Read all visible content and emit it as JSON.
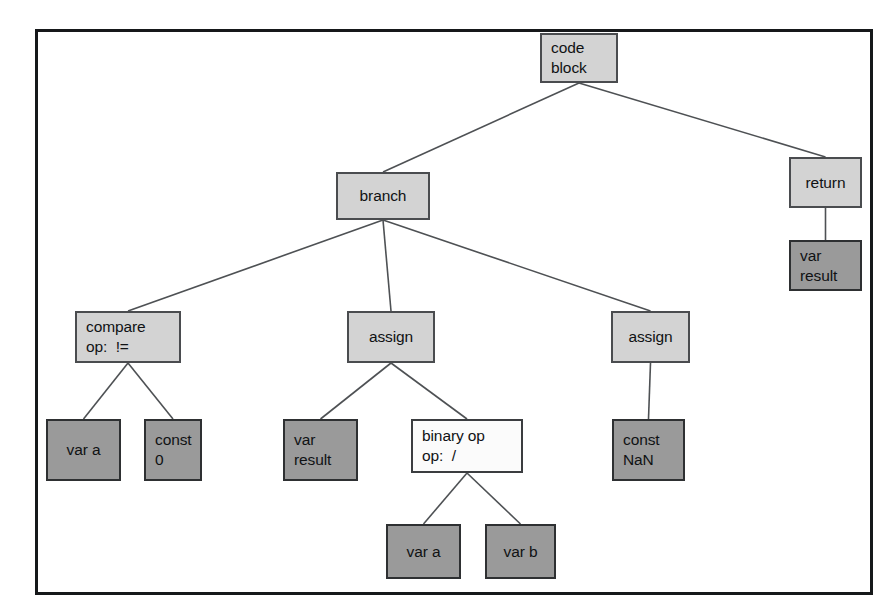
{
  "diagram": {
    "frame": {
      "border_color": "#16181a",
      "background": "#ffffff"
    },
    "colors": {
      "light_node_fill": "#d3d3d3",
      "dark_node_fill": "#9a9a9a",
      "white_node_fill": "#fbfbfb",
      "node_border": "#3b3d40",
      "edge_color": "#4e5154",
      "text_color": "#101214"
    },
    "nodes": [
      {
        "id": "code-block",
        "line1": "code",
        "line2": "block",
        "fill": "light",
        "x": 540,
        "y": 33,
        "w": 78,
        "h": 50
      },
      {
        "id": "branch",
        "line1": "branch",
        "line2": "",
        "fill": "light",
        "x": 336,
        "y": 172,
        "w": 94,
        "h": 48
      },
      {
        "id": "return",
        "line1": "return",
        "line2": "",
        "fill": "light",
        "x": 789,
        "y": 157,
        "w": 73,
        "h": 51
      },
      {
        "id": "var-result-r",
        "line1": "var",
        "line2": "result",
        "fill": "dark",
        "x": 789,
        "y": 240,
        "w": 73,
        "h": 51
      },
      {
        "id": "compare",
        "line1": "compare",
        "line2": "op:  !=",
        "fill": "light",
        "x": 75,
        "y": 311,
        "w": 106,
        "h": 52
      },
      {
        "id": "assign-mid",
        "line1": "assign",
        "line2": "",
        "fill": "light",
        "x": 347,
        "y": 311,
        "w": 88,
        "h": 52
      },
      {
        "id": "assign-right",
        "line1": "assign",
        "line2": "",
        "fill": "light",
        "x": 611,
        "y": 311,
        "w": 79,
        "h": 52
      },
      {
        "id": "var-a-1",
        "line1": "var a",
        "line2": "",
        "fill": "dark",
        "x": 46,
        "y": 419,
        "w": 75,
        "h": 62
      },
      {
        "id": "const-0",
        "line1": "const",
        "line2": "0",
        "fill": "dark",
        "x": 144,
        "y": 419,
        "w": 58,
        "h": 62
      },
      {
        "id": "var-result-m",
        "line1": "var",
        "line2": "result",
        "fill": "dark",
        "x": 283,
        "y": 419,
        "w": 75,
        "h": 62
      },
      {
        "id": "binary-op",
        "line1": "binary op",
        "line2": "op:  /",
        "fill": "white",
        "x": 411,
        "y": 419,
        "w": 112,
        "h": 54
      },
      {
        "id": "const-nan",
        "line1": "const",
        "line2": "NaN",
        "fill": "dark",
        "x": 612,
        "y": 419,
        "w": 73,
        "h": 62
      },
      {
        "id": "var-a-2",
        "line1": "var a",
        "line2": "",
        "fill": "dark",
        "x": 386,
        "y": 524,
        "w": 75,
        "h": 55
      },
      {
        "id": "var-b",
        "line1": "var b",
        "line2": "",
        "fill": "dark",
        "x": 485,
        "y": 524,
        "w": 71,
        "h": 55
      }
    ],
    "edges": [
      {
        "from": "code-block",
        "to": "branch"
      },
      {
        "from": "code-block",
        "to": "return"
      },
      {
        "from": "return",
        "to": "var-result-r"
      },
      {
        "from": "branch",
        "to": "compare"
      },
      {
        "from": "branch",
        "to": "assign-mid"
      },
      {
        "from": "branch",
        "to": "assign-right"
      },
      {
        "from": "compare",
        "to": "var-a-1"
      },
      {
        "from": "compare",
        "to": "const-0"
      },
      {
        "from": "assign-mid",
        "to": "var-result-m"
      },
      {
        "from": "assign-mid",
        "to": "binary-op"
      },
      {
        "from": "assign-right",
        "to": "const-nan"
      },
      {
        "from": "binary-op",
        "to": "var-a-2"
      },
      {
        "from": "binary-op",
        "to": "var-b"
      }
    ]
  }
}
